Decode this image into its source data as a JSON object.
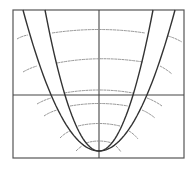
{
  "diagram": {
    "title": "",
    "colors": {
      "background": "#ffffff",
      "frame": "#555555",
      "axes": "#444444",
      "curves": "#333333",
      "arcs": "#888888"
    },
    "frame": {
      "x": 13,
      "y": 10,
      "width": 171,
      "height": 148
    },
    "axes": {
      "vertical_x": 99,
      "horizontal_y": 95
    },
    "vertex": {
      "x": 99,
      "y": 151
    },
    "curves": [
      {
        "name": "outer-parabola",
        "half_width_at_top": 76
      },
      {
        "name": "inner-parabola",
        "half_width_at_top": 54
      }
    ],
    "arc_center_ys": [
      31,
      59,
      91,
      104,
      124,
      141
    ]
  }
}
